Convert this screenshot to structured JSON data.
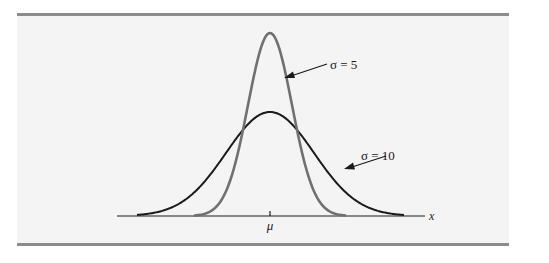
{
  "chart_data": {
    "type": "line",
    "title": "",
    "xlabel": "x",
    "ylabel": "",
    "grid": false,
    "legend": "none (inline arrow annotations)",
    "x_tick_labels": [
      "μ"
    ],
    "series": [
      {
        "name": "σ = 5",
        "sigma": 5,
        "mean": "μ",
        "color": "#707070",
        "peak_relative_height": 1.0,
        "description": "Taller, narrower normal curve"
      },
      {
        "name": "σ = 10",
        "sigma": 10,
        "mean": "μ",
        "color": "#1a1a1a",
        "peak_relative_height": 0.5,
        "description": "Shorter, wider normal curve"
      }
    ],
    "annotations": [
      {
        "text": "σ = 5",
        "points_to": "σ = 5 curve, right flank"
      },
      {
        "text": "σ = 10",
        "points_to": "σ = 10 curve, right flank"
      }
    ]
  },
  "labels": {
    "sigma5": "σ = 5",
    "sigma10": "σ = 10",
    "mu": "μ",
    "x_axis": "x"
  },
  "colors": {
    "background": "#f4f4f4",
    "rule": "#8c8c8c",
    "curve_sigma5": "#707070",
    "curve_sigma10": "#1a1a1a",
    "axis": "#1a1a1a"
  }
}
